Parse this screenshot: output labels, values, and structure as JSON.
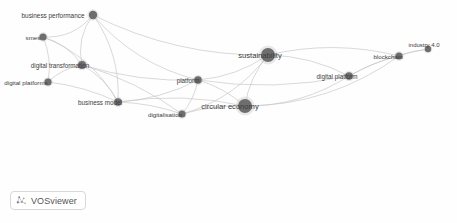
{
  "visualization": {
    "tool": "VOSviewer",
    "type": "bibliometric-network-map",
    "background_color": "#fefefe",
    "node_color": "#6e6e6e",
    "edge_color": "#c9c9c9",
    "label_color": "#3c3c3c",
    "width": 457,
    "height": 223
  },
  "chart_data": {
    "type": "network",
    "title": "",
    "nodes": [
      {
        "id": "business-performance",
        "label": "business performance",
        "x": 93,
        "y": 15,
        "size": 4.2,
        "font_size": 6.4,
        "label_dx": -40,
        "label_dy": 0
      },
      {
        "id": "smes",
        "label": "smes",
        "x": 43,
        "y": 37,
        "size": 3.6,
        "font_size": 6.2,
        "label_dx": -10,
        "label_dy": 0
      },
      {
        "id": "digital-transformation",
        "label": "digital transformation",
        "x": 82,
        "y": 65,
        "size": 4.0,
        "font_size": 6.3,
        "label_dx": -22,
        "label_dy": 0
      },
      {
        "id": "digital-platforms",
        "label": "digital platforms",
        "x": 48,
        "y": 82,
        "size": 3.6,
        "font_size": 6.2,
        "label_dx": -22,
        "label_dy": 0
      },
      {
        "id": "business-model",
        "label": "business model",
        "x": 118,
        "y": 102,
        "size": 3.8,
        "font_size": 6.3,
        "label_dx": -18,
        "label_dy": 0
      },
      {
        "id": "digitalisation",
        "label": "digitalisation",
        "x": 182,
        "y": 114,
        "size": 3.6,
        "font_size": 6.2,
        "label_dx": -17,
        "label_dy": 0
      },
      {
        "id": "platform",
        "label": "platform",
        "x": 198,
        "y": 80,
        "size": 3.8,
        "font_size": 6.3,
        "label_dx": -10,
        "label_dy": 0
      },
      {
        "id": "sustainability",
        "label": "sustainability",
        "x": 268,
        "y": 55,
        "size": 7.0,
        "font_size": 7.6,
        "label_dx": -8,
        "label_dy": 0
      },
      {
        "id": "circular-economy",
        "label": "circular economy",
        "x": 245,
        "y": 106,
        "size": 7.0,
        "font_size": 7.6,
        "label_dx": -15,
        "label_dy": 0
      },
      {
        "id": "digital-platform",
        "label": "digital platform",
        "x": 349,
        "y": 76,
        "size": 3.8,
        "font_size": 6.3,
        "label_dx": -12,
        "label_dy": 0
      },
      {
        "id": "blockchain",
        "label": "blockchain",
        "x": 399,
        "y": 56,
        "size": 3.6,
        "font_size": 6.2,
        "label_dx": -11,
        "label_dy": 0
      },
      {
        "id": "industry-4-0",
        "label": "industry 4.0",
        "x": 428,
        "y": 49,
        "size": 3.2,
        "font_size": 6.0,
        "label_dx": -4,
        "label_dy": -4
      }
    ],
    "edges": [
      {
        "source": "business-performance",
        "target": "smes",
        "curve": -14
      },
      {
        "source": "business-performance",
        "target": "digital-transformation",
        "curve": 12
      },
      {
        "source": "business-performance",
        "target": "business-model",
        "curve": -16
      },
      {
        "source": "business-performance",
        "target": "sustainability",
        "curve": 22
      },
      {
        "source": "business-performance",
        "target": "platform",
        "curve": 20
      },
      {
        "source": "smes",
        "target": "digital-transformation",
        "curve": -9
      },
      {
        "source": "smes",
        "target": "digital-platforms",
        "curve": -7
      },
      {
        "source": "smes",
        "target": "business-model",
        "curve": -18
      },
      {
        "source": "digital-transformation",
        "target": "digital-platforms",
        "curve": 6
      },
      {
        "source": "digital-transformation",
        "target": "business-model",
        "curve": -8
      },
      {
        "source": "digital-transformation",
        "target": "platform",
        "curve": 10
      },
      {
        "source": "digital-transformation",
        "target": "digitalisation",
        "curve": -10
      },
      {
        "source": "digital-platforms",
        "target": "business-model",
        "curve": -6
      },
      {
        "source": "business-model",
        "target": "digitalisation",
        "curve": -5
      },
      {
        "source": "business-model",
        "target": "platform",
        "curve": 9
      },
      {
        "source": "business-model",
        "target": "circular-economy",
        "curve": -12
      },
      {
        "source": "digitalisation",
        "target": "platform",
        "curve": 5
      },
      {
        "source": "digitalisation",
        "target": "circular-economy",
        "curve": -5
      },
      {
        "source": "digitalisation",
        "target": "sustainability",
        "curve": 18
      },
      {
        "source": "platform",
        "target": "sustainability",
        "curve": 10
      },
      {
        "source": "platform",
        "target": "circular-economy",
        "curve": -6
      },
      {
        "source": "platform",
        "target": "digital-platform",
        "curve": 14
      },
      {
        "source": "sustainability",
        "target": "circular-economy",
        "curve": 8
      },
      {
        "source": "sustainability",
        "target": "digital-platform",
        "curve": -10
      },
      {
        "source": "sustainability",
        "target": "blockchain",
        "curve": -16
      },
      {
        "source": "circular-economy",
        "target": "digital-platform",
        "curve": 16
      },
      {
        "source": "circular-economy",
        "target": "blockchain",
        "curve": 26
      },
      {
        "source": "digital-platform",
        "target": "blockchain",
        "curve": -4
      },
      {
        "source": "blockchain",
        "target": "industry-4-0",
        "curve": -2
      },
      {
        "source": "digital-platform",
        "target": "industry-4-0",
        "curve": -8
      }
    ],
    "legend": null,
    "axes": null
  },
  "branding": {
    "logo_label": "VOSviewer",
    "logo_icon": "vosviewer-mark-icon"
  }
}
